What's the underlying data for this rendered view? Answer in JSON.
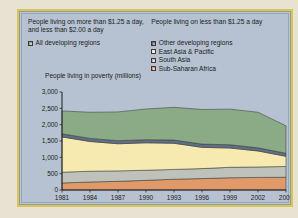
{
  "source_credit": "Source: Atlas of Global Development, 2011",
  "legend": {
    "heading_left": "People living on more than $1.25 a day, and less than $2.00 a day",
    "heading_right": "People living on less than $1.25 a day",
    "left_items": [
      {
        "label": "All developing regions",
        "color": "#8aab85"
      }
    ],
    "right_items": [
      {
        "label": "Other developing regions",
        "color": "#5f6f86"
      },
      {
        "label": "East Asia & Pacific",
        "color": "#f7eab1"
      },
      {
        "label": "South Asia",
        "color": "#bfc2bb"
      },
      {
        "label": "Sub-Saharan Africa",
        "color": "#e09a6a"
      }
    ]
  },
  "chart_data": {
    "type": "area",
    "title": "",
    "ylabel": "People living in poverty (millions)",
    "xlabel": "",
    "ylim": [
      0,
      3000
    ],
    "yticks": [
      0,
      500,
      1000,
      1500,
      2000,
      2500,
      3000
    ],
    "ytick_labels": [
      "0",
      "500",
      "1,000",
      "1,500",
      "2,000",
      "2,500",
      "3,000"
    ],
    "x": [
      1981,
      1984,
      1987,
      1990,
      1993,
      1996,
      1999,
      2002,
      2005
    ],
    "xtick_labels": [
      "1981",
      "1984",
      "1987",
      "1990",
      "1993",
      "1996",
      "1999",
      "2002",
      "2005"
    ],
    "grid": false,
    "legend_position": "top",
    "stacked": true,
    "series": [
      {
        "name": "Sub-Saharan Africa",
        "color": "#e09a6a",
        "values": [
          215,
          245,
          265,
          295,
          330,
          350,
          375,
          385,
          390
        ]
      },
      {
        "name": "South Asia",
        "color": "#bfc2bb",
        "values": [
          330,
          330,
          320,
          310,
          300,
          305,
          320,
          320,
          330
        ]
      },
      {
        "name": "East Asia & Pacific",
        "color": "#f7eab1",
        "values": [
          1080,
          910,
          830,
          840,
          800,
          650,
          590,
          490,
          310
        ]
      },
      {
        "name": "Other developing regions",
        "color": "#5f6f86",
        "values": [
          95,
          95,
          95,
          95,
          100,
          100,
          100,
          95,
          95
        ]
      },
      {
        "name": "All developing regions",
        "color": "#8aab85",
        "values": [
          700,
          800,
          880,
          940,
          1000,
          1060,
          1090,
          1090,
          840
        ]
      }
    ]
  }
}
